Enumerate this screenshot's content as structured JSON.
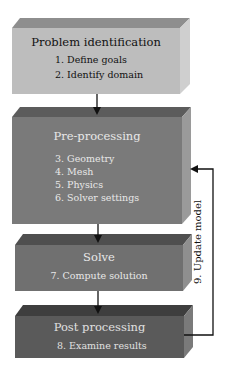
{
  "diagram": {
    "stages": [
      {
        "title": "Problem identification",
        "items": [
          "1. Define goals",
          "2. Identify domain"
        ],
        "colors": {
          "front": "#bdbdbd",
          "top": "#8e8e8e",
          "side": "#cfcfcf",
          "text": "#111111"
        }
      },
      {
        "title": "Pre-processing",
        "items": [
          "3. Geometry",
          "4. Mesh",
          "5. Physics",
          "6. Solver settings"
        ],
        "colors": {
          "front": "#7a7a7a",
          "top": "#5c5c5c",
          "side": "#9a9a9a",
          "text": "#e8e8e8"
        }
      },
      {
        "title": "Solve",
        "items": [
          "7. Compute solution"
        ],
        "colors": {
          "front": "#707070",
          "top": "#4f4f4f",
          "side": "#8f8f8f",
          "text": "#e8e8e8"
        }
      },
      {
        "title": "Post processing",
        "items": [
          "8. Examine results"
        ],
        "colors": {
          "front": "#5a5a5a",
          "top": "#3e3e3e",
          "side": "#7a7a7a",
          "text": "#e0e0e0"
        }
      }
    ],
    "feedback_label": "9. Update model",
    "arrow_color": "#111111"
  }
}
